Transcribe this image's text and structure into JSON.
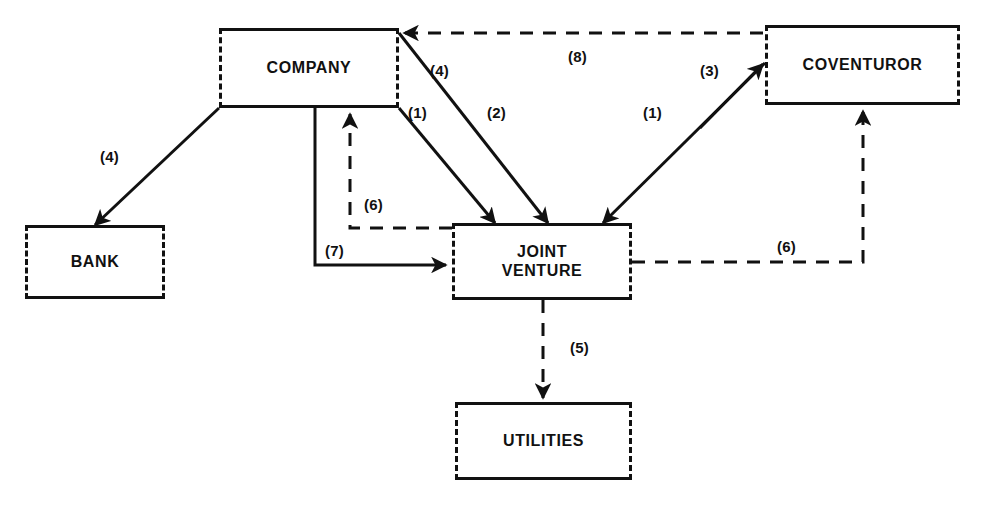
{
  "diagram": {
    "canvas": {
      "width": 984,
      "height": 515
    },
    "stroke_color": "#111111",
    "background_color": "#ffffff",
    "nodes": [
      {
        "id": "company",
        "label": "COMPANY",
        "x": 219,
        "y": 28,
        "w": 180,
        "h": 80
      },
      {
        "id": "coventuror",
        "label": "COVENTUROR",
        "x": 765,
        "y": 25,
        "w": 195,
        "h": 80
      },
      {
        "id": "bank",
        "label": "BANK",
        "x": 25,
        "y": 225,
        "w": 140,
        "h": 74
      },
      {
        "id": "jv",
        "label": "JOINT\nVENTURE",
        "x": 452,
        "y": 223,
        "w": 180,
        "h": 77
      },
      {
        "id": "utilities",
        "label": "UTILITIES",
        "x": 455,
        "y": 402,
        "w": 177,
        "h": 78
      }
    ],
    "edges": [
      {
        "id": "e-company-bank",
        "label": "(4)",
        "style": "solid",
        "from": "company",
        "to": "bank",
        "label_x": 100,
        "label_y": 148
      },
      {
        "id": "e-company-jv-1",
        "label": "(1)",
        "style": "solid",
        "from": "company",
        "to": "jv",
        "label_x": 408,
        "label_y": 104
      },
      {
        "id": "e-company-jv-2",
        "label": "(2)",
        "style": "solid",
        "from": "company",
        "to": "jv",
        "label_x": 487,
        "label_y": 104
      },
      {
        "id": "e-company-coventuror-4",
        "label": "(4)",
        "style": "solid",
        "from": "company",
        "to": "coventuror",
        "label_x": 430,
        "label_y": 62
      },
      {
        "id": "e-coventuror-jv-1",
        "label": "(1)",
        "style": "solid",
        "from": "coventuror",
        "to": "jv",
        "label_x": 643,
        "label_y": 104
      },
      {
        "id": "e-jv-coventuror-3",
        "label": "(3)",
        "style": "solid",
        "from": "jv",
        "to": "coventuror",
        "label_x": 700,
        "label_y": 62
      },
      {
        "id": "e-jv-company-6",
        "label": "(6)",
        "style": "dashed",
        "from": "jv",
        "to": "company",
        "label_x": 364,
        "label_y": 196
      },
      {
        "id": "e-company-jv-7",
        "label": "(7)",
        "style": "solid",
        "from": "company",
        "to": "jv",
        "label_x": 325,
        "label_y": 242
      },
      {
        "id": "e-jv-coventuror-6",
        "label": "(6)",
        "style": "dashed",
        "from": "jv",
        "to": "coventuror",
        "label_x": 777,
        "label_y": 238
      },
      {
        "id": "e-jv-utilities-5",
        "label": "(5)",
        "style": "dashed",
        "from": "jv",
        "to": "utilities",
        "label_x": 570,
        "label_y": 339
      },
      {
        "id": "e-coventuror-company-8",
        "label": "(8)",
        "style": "dashed",
        "from": "coventuror",
        "to": "company",
        "label_x": 568,
        "label_y": 48
      }
    ]
  }
}
